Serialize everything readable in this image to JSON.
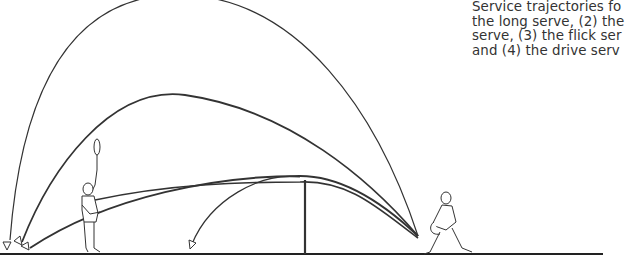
{
  "caption": {
    "lines": [
      "Service trajectories fo",
      "the long serve, (2) the",
      "serve, (3) the flick ser",
      "and (4) the drive serv"
    ]
  },
  "figure": {
    "trajectories": [
      {
        "id": 1,
        "name": "long serve"
      },
      {
        "id": 2,
        "name": "high serve"
      },
      {
        "id": 3,
        "name": "flick serve"
      },
      {
        "id": 4,
        "name": "drive serve"
      },
      {
        "id": 5,
        "name": "short serve"
      }
    ],
    "figures": [
      "receiver-player",
      "server-player"
    ],
    "net": true
  }
}
